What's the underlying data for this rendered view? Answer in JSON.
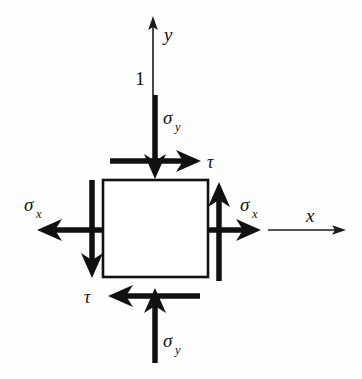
{
  "figure": {
    "type": "stress-element-diagram",
    "canvas": {
      "width": 362,
      "height": 379
    },
    "background_color": "#fefefe",
    "ink_color": "#111111"
  },
  "element": {
    "name": "stress-square",
    "left": 103,
    "top": 180,
    "right": 208,
    "bottom": 277,
    "fill": "#ffffff",
    "stroke": "#111111"
  },
  "axes": {
    "y_axis": {
      "label": "y",
      "label_x": 164,
      "label_y": 40,
      "x": 153,
      "from_y": 95,
      "to_y": 18
    },
    "x_axis": {
      "label": "x",
      "label_x": 312,
      "label_y": 222,
      "y": 230,
      "from_x": 268,
      "to_x": 345
    },
    "origin_marker": {
      "label": "1",
      "x": 140,
      "y": 85
    }
  },
  "loads": [
    {
      "name": "sigma-y-top",
      "symbol": "σ",
      "subscript": "y",
      "direction": "down",
      "label_x": 163,
      "label_y": 124,
      "shaft_x": 155,
      "from": 95,
      "to": 178
    },
    {
      "name": "sigma-y-bottom",
      "symbol": "σ",
      "subscript": "y",
      "direction": "up",
      "label_x": 163,
      "label_y": 345,
      "shaft_x": 155,
      "from": 363,
      "to": 288
    },
    {
      "name": "sigma-x-left",
      "symbol": "σ",
      "subscript": "x",
      "direction": "left",
      "label_x": 26,
      "label_y": 212,
      "shaft_y": 230,
      "from": 103,
      "to": 38
    },
    {
      "name": "sigma-x-right",
      "symbol": "σ",
      "subscript": "x",
      "direction": "right",
      "label_x": 240,
      "label_y": 212,
      "shaft_y": 230,
      "from": 208,
      "to": 258
    },
    {
      "name": "tau-top",
      "symbol": "τ",
      "subscript": "",
      "direction": "right",
      "label_x": 206,
      "label_y": 167,
      "shaft_y": 161,
      "from": 110,
      "to": 200
    },
    {
      "name": "tau-bottom",
      "symbol": "τ",
      "subscript": "",
      "direction": "left",
      "label_x": 88,
      "label_y": 303,
      "shaft_y": 296,
      "from": 200,
      "to": 110
    },
    {
      "name": "shear-left-vertical",
      "symbol": "",
      "subscript": "",
      "direction": "down",
      "shaft_x": 92,
      "from": 180,
      "to": 277
    },
    {
      "name": "shear-right-vertical",
      "symbol": "",
      "subscript": "",
      "direction": "up",
      "shaft_x": 219,
      "from": 280,
      "to": 182
    }
  ]
}
